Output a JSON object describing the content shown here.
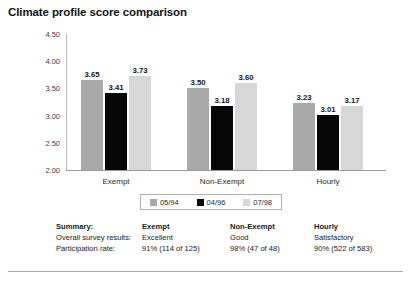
{
  "chart_data": {
    "type": "bar",
    "title": "Climate profile score comparison",
    "xlabel": "",
    "ylabel": "",
    "ylim": [
      2.0,
      4.5
    ],
    "ytick_labels": [
      "4.50",
      "4.00",
      "3.50",
      "3.00",
      "2.50",
      "2.00"
    ],
    "ytick_values": [
      4.5,
      4.0,
      3.5,
      3.0,
      2.5,
      2.0
    ],
    "grid": false,
    "legend_position": "bottom-center",
    "categories": [
      "Exempt",
      "Non-Exempt",
      "Hourly"
    ],
    "series": [
      {
        "name": "05/94",
        "color": "#a9a9a9",
        "values": [
          3.65,
          3.5,
          3.23
        ]
      },
      {
        "name": "04/96",
        "color": "#070707",
        "values": [
          3.41,
          3.18,
          3.01
        ]
      },
      {
        "name": "07/98",
        "color": "#d7d7d7",
        "values": [
          3.73,
          3.6,
          3.17
        ]
      }
    ],
    "value_labels": [
      [
        "3.65",
        "3.41",
        "3.73"
      ],
      [
        "3.50",
        "3.18",
        "3.60"
      ],
      [
        "3.23",
        "3.01",
        "3.17"
      ]
    ]
  },
  "summary": {
    "heading": "Summary:",
    "rows": [
      {
        "label": "Overall survey results:",
        "values": [
          "Excellent",
          "Good",
          "Satisfactory"
        ]
      },
      {
        "label": "Participation rate:",
        "values": [
          "91% (114 of 125)",
          "98% (47 of 48)",
          "90% (522 of 583)"
        ]
      }
    ],
    "column_headers": [
      "Exempt",
      "Non-Exempt",
      "Hourly"
    ]
  }
}
